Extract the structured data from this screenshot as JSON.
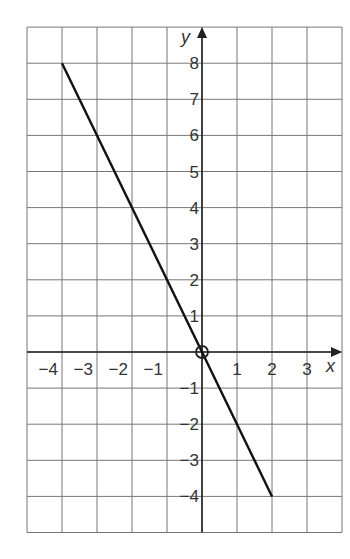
{
  "chart_data": {
    "type": "line",
    "title": "",
    "xlabel": "x",
    "ylabel": "y",
    "xlim": [
      -5,
      4
    ],
    "ylim": [
      -5,
      9
    ],
    "grid": true,
    "x_ticks": [
      "-4",
      "-3",
      "-2",
      "-1",
      "1",
      "2",
      "3"
    ],
    "y_ticks": [
      "8",
      "7",
      "6",
      "5",
      "4",
      "3",
      "2",
      "1",
      "-1",
      "-2",
      "-3",
      "-4"
    ],
    "series": [
      {
        "name": "y = -2x",
        "x": [
          -4,
          0,
          2
        ],
        "y": [
          8,
          0,
          -4
        ],
        "color": "#111111"
      }
    ],
    "annotations": [
      {
        "type": "circle",
        "x": 0,
        "y": 0,
        "label": "origin marker"
      }
    ]
  }
}
